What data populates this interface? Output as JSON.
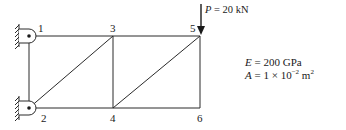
{
  "diagram": {
    "type": "plane truss",
    "nodes": [
      {
        "id": "1",
        "x": 29,
        "y": 36,
        "support": "pin-wall"
      },
      {
        "id": "2",
        "x": 29,
        "y": 108,
        "support": "pin-wall"
      },
      {
        "id": "3",
        "x": 113,
        "y": 36
      },
      {
        "id": "4",
        "x": 113,
        "y": 108
      },
      {
        "id": "5",
        "x": 200,
        "y": 36
      },
      {
        "id": "6",
        "x": 200,
        "y": 108
      }
    ],
    "members": [
      [
        "1",
        "3"
      ],
      [
        "3",
        "5"
      ],
      [
        "2",
        "4"
      ],
      [
        "4",
        "6"
      ],
      [
        "1",
        "2"
      ],
      [
        "3",
        "4"
      ],
      [
        "5",
        "6"
      ],
      [
        "2",
        "3"
      ],
      [
        "4",
        "5"
      ]
    ],
    "node_labels": {
      "n1": "1",
      "n2": "2",
      "n3": "3",
      "n4": "4",
      "n5": "5",
      "n6": "6"
    },
    "load": {
      "symbol": "P",
      "equals": " = ",
      "value": "20 kN",
      "at_node": "5",
      "direction": "down"
    },
    "properties": {
      "E_symbol": "E",
      "E_rest": " = 200 GPa",
      "A_symbol": "A",
      "A_rest": " = 1 × 10",
      "A_exp": "−2",
      "A_unit": " m",
      "A_unit_exp": "2"
    }
  }
}
